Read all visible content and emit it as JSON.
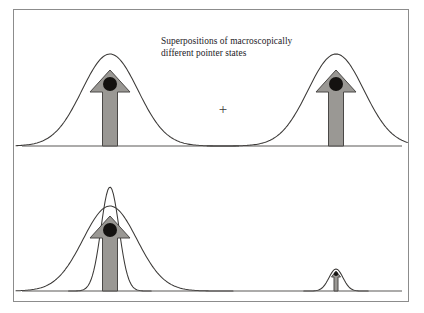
{
  "figure": {
    "width": 424,
    "height": 313,
    "background_color": "#ffffff",
    "frame_color": "#8c8c8c"
  },
  "panels": {
    "top": {
      "caption": "Superpositions of macroscopically\ndifferent pointer states",
      "operator": "+",
      "baseline_label": "pointer position axis"
    },
    "bottom": {
      "caption": "Hitting one particle of the\npointer reduces the state"
    }
  },
  "colors": {
    "arrow_fill": "#9a9894",
    "arrow_stroke": "#4a4846",
    "dot_fill": "#141210",
    "curve_stroke": "#3b3937",
    "baseline_stroke": "#5a5856",
    "text": "#23211f"
  },
  "chart_data": {
    "type": "line",
    "title": "Superpositions of macroscopically different pointer states",
    "xlabel": "",
    "ylabel": "",
    "grid": false,
    "legend": "none",
    "panels": [
      {
        "name": "top-panel",
        "caption": "Superpositions of macroscopically different pointer states",
        "operator": "+",
        "xlim": [
          0,
          396
        ],
        "ylim": [
          0,
          148
        ],
        "baseline_y": 136,
        "series": [
          {
            "name": "left-wavepacket",
            "type": "gaussian",
            "center": 96,
            "amplitude": 92,
            "sigma": 28
          },
          {
            "name": "right-wavepacket",
            "type": "gaussian",
            "center": 322,
            "amplitude": 92,
            "sigma": 28
          }
        ],
        "markers": [
          {
            "name": "left-pointer-arrow",
            "type": "up-arrow",
            "x": 96,
            "base_y": 136,
            "tip_y": 60,
            "shaft_width": 15,
            "head_width": 40,
            "head_height": 22,
            "dot_x": 96,
            "dot_y": 74,
            "dot_r": 7
          },
          {
            "name": "right-pointer-arrow",
            "type": "up-arrow",
            "x": 322,
            "base_y": 136,
            "tip_y": 60,
            "shaft_width": 15,
            "head_width": 40,
            "head_height": 22,
            "dot_x": 322,
            "dot_y": 74,
            "dot_r": 7
          }
        ]
      },
      {
        "name": "bottom-panel",
        "caption": "Hitting one particle of the pointer reduces the state",
        "xlim": [
          0,
          396
        ],
        "ylim": [
          0,
          145
        ],
        "baseline_y": 133,
        "series": [
          {
            "name": "left-wide-wavepacket",
            "type": "gaussian",
            "center": 96,
            "amplitude": 85,
            "sigma": 27
          },
          {
            "name": "left-narrow-wavepacket",
            "type": "gaussian",
            "center": 96,
            "amplitude": 104,
            "sigma": 9
          },
          {
            "name": "right-reduced-wavepacket",
            "type": "gaussian",
            "center": 322,
            "amplitude": 22,
            "sigma": 7
          }
        ],
        "markers": [
          {
            "name": "left-pointer-arrow",
            "type": "up-arrow",
            "x": 96,
            "base_y": 133,
            "tip_y": 58,
            "shaft_width": 15,
            "head_width": 40,
            "head_height": 22,
            "dot_x": 96,
            "dot_y": 72,
            "dot_r": 7
          },
          {
            "name": "right-reduced-arrow",
            "type": "up-arrow",
            "x": 322,
            "base_y": 133,
            "tip_y": 113,
            "shaft_width": 4,
            "head_width": 9,
            "head_height": 6,
            "dot_x": 322,
            "dot_y": 116,
            "dot_r": 2.1
          }
        ]
      }
    ]
  }
}
